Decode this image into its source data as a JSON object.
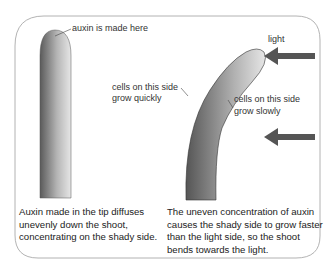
{
  "labels": {
    "auxin_made": "auxin is made here",
    "light": "light",
    "cells_quick_line1": "cells on this side",
    "cells_quick_line2": "grow quickly",
    "cells_slow_line1": "cells on this side",
    "cells_slow_line2": "grow slowly"
  },
  "captions": {
    "left": [
      "Auxin made in the tip diffuses",
      "unevenly down the shoot,",
      "concentrating on the shady side."
    ],
    "right": [
      "The uneven concentration of auxin",
      "causes the shady side to grow faster",
      "than the light side, so the shoot",
      "bends towards the light."
    ]
  },
  "colors": {
    "border": "#9a9a9a",
    "arrow": "#555555",
    "shoot_dark": "#5a5a5a",
    "shoot_light": "#e2e2e2"
  }
}
